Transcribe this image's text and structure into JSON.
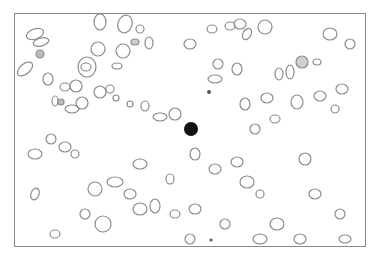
{
  "image": {
    "description": "Grayscale microscopy field of many outlined oval cells with one dark solid cell near center",
    "background": "#ffffff",
    "border_color": "#8a8a8a",
    "cell_stroke": "#8c8c8c",
    "dark_cell_color": "#111111",
    "dark_cell": {
      "cx": 176,
      "cy": 115,
      "r": 7
    }
  }
}
